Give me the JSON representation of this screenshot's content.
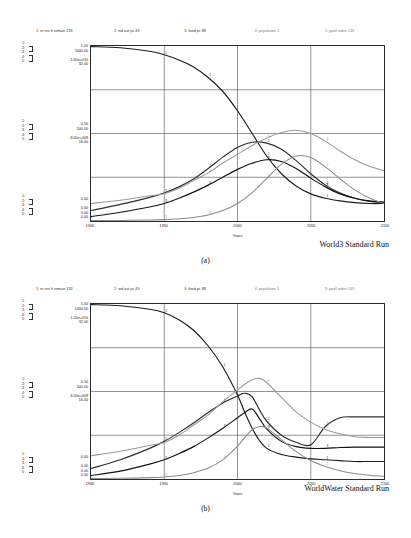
{
  "figure": {
    "panels": [
      {
        "letter": "(a)",
        "run_label": "World3 Standard Run",
        "legend": [
          "1: nr res fr remain 133",
          "2: ind out pc 49",
          "3: food pc 88",
          "4: population 1",
          "5: ppoll index 143"
        ],
        "scales": {
          "top": [
            "1.00",
            "1000.00",
            "1.60e+010",
            "32.00"
          ],
          "middle": [
            "0.50",
            "500.00",
            "8.00e+009",
            "16.00"
          ],
          "bottom": [
            "0.00",
            "0.00",
            "0.00",
            "0.00"
          ]
        },
        "index_labels": {
          "top": [
            "1:",
            "2:",
            "3:",
            "4:",
            "5:"
          ],
          "middle": [
            "1:",
            "2:",
            "3:",
            "4:",
            "5:"
          ],
          "bottom": [
            "1:",
            "2:",
            "3:",
            "4:",
            "5:"
          ]
        },
        "xaxis": {
          "title": "Years",
          "ticks": [
            "1900",
            "1950",
            "2000",
            "2050",
            "2100"
          ]
        }
      },
      {
        "letter": "(b)",
        "run_label": "WorldWater Standard Run",
        "legend": [
          "1: nr res fr remain 133",
          "2: ind out pc 49",
          "3: food pc 88",
          "4: population 1",
          "5: ppoll index 143"
        ],
        "scales": {
          "top": [
            "1.00",
            "1000.00",
            "1.20e+010",
            "32.00"
          ],
          "middle": [
            "0.50",
            "500.00",
            "6.00e+009",
            "16.00"
          ],
          "bottom": [
            "0.00",
            "0.00",
            "0.00",
            "0.00"
          ]
        },
        "index_labels": {
          "top": [
            "1:",
            "2:",
            "3:",
            "4:",
            "5:"
          ],
          "middle": [
            "1:",
            "2:",
            "3:",
            "4:",
            "5:"
          ],
          "bottom": [
            "1:",
            "2:",
            "3:",
            "4:",
            "5:"
          ]
        },
        "xaxis": {
          "title": "Years",
          "ticks": [
            "1900",
            "1950",
            "2000",
            "2050",
            "2100"
          ]
        }
      }
    ]
  },
  "chart_data": [
    {
      "type": "line",
      "title": "World3 Standard Run",
      "panel": "(a)",
      "xlabel": "Years",
      "ylabel": "",
      "xlim": [
        1900,
        2100
      ],
      "grid": true,
      "legend_position": "top",
      "x": [
        1900,
        1920,
        1940,
        1950,
        1960,
        1970,
        1980,
        1990,
        2000,
        2010,
        2020,
        2030,
        2040,
        2050,
        2060,
        2070,
        2080,
        2090,
        2100
      ],
      "series": [
        {
          "name": "nr res fr remain",
          "key": "1",
          "units": "fraction",
          "ylim": [
            0.0,
            1.0
          ],
          "values": [
            1.0,
            0.99,
            0.97,
            0.95,
            0.92,
            0.88,
            0.82,
            0.74,
            0.63,
            0.5,
            0.37,
            0.27,
            0.2,
            0.155,
            0.13,
            0.115,
            0.105,
            0.1,
            0.1
          ]
        },
        {
          "name": "ind out pc",
          "key": "2",
          "units": "dollars per person per year",
          "ylim": [
            0.0,
            1000.0
          ],
          "values": [
            60,
            95,
            135,
            160,
            195,
            240,
            300,
            365,
            420,
            450,
            445,
            410,
            345,
            270,
            205,
            160,
            130,
            112,
            105
          ]
        },
        {
          "name": "food pc",
          "key": "3",
          "units": "kilograms per person per year",
          "ylim": [
            0.0,
            1000.0
          ],
          "values": [
            25,
            50,
            80,
            100,
            130,
            165,
            205,
            250,
            295,
            330,
            350,
            340,
            300,
            245,
            195,
            155,
            130,
            115,
            108
          ]
        },
        {
          "name": "population",
          "key": "4",
          "units": "persons",
          "ylim": [
            0.0,
            16000000000.0
          ],
          "values": [
            1600000000.0,
            1900000000.0,
            2300000000.0,
            2500000000.0,
            3000000000.0,
            3700000000.0,
            4400000000.0,
            5300000000.0,
            6100000000.0,
            6900000000.0,
            7600000000.0,
            8100000000.0,
            8300000000.0,
            8000000000.0,
            7300000000.0,
            6400000000.0,
            5600000000.0,
            5000000000.0,
            4600000000.0
          ]
        },
        {
          "name": "ppoll index",
          "key": "5",
          "units": "index",
          "ylim": [
            0.0,
            32.0
          ],
          "values": [
            0.05,
            0.1,
            0.18,
            0.25,
            0.4,
            0.65,
            1.1,
            1.9,
            3.2,
            5.2,
            7.8,
            10.4,
            11.9,
            11.6,
            9.9,
            7.7,
            5.7,
            4.2,
            3.2
          ]
        }
      ]
    },
    {
      "type": "line",
      "title": "WorldWater Standard Run",
      "panel": "(b)",
      "xlabel": "Years",
      "ylabel": "",
      "xlim": [
        1900,
        2100
      ],
      "grid": true,
      "legend_position": "top",
      "x": [
        1900,
        1920,
        1940,
        1950,
        1960,
        1970,
        1980,
        1990,
        2000,
        2005,
        2010,
        2015,
        2020,
        2030,
        2040,
        2050,
        2060,
        2070,
        2080,
        2090,
        2100
      ],
      "series": [
        {
          "name": "nr res fr remain",
          "key": "1",
          "units": "fraction",
          "ylim": [
            0.0,
            1.0
          ],
          "values": [
            1.0,
            0.99,
            0.97,
            0.95,
            0.91,
            0.85,
            0.76,
            0.64,
            0.48,
            0.38,
            0.29,
            0.22,
            0.175,
            0.14,
            0.125,
            0.115,
            0.11,
            0.105,
            0.1,
            0.1,
            0.1
          ]
        },
        {
          "name": "ind out pc",
          "key": "2",
          "units": "dollars per person per year",
          "ylim": [
            0.0,
            1000.0
          ],
          "values": [
            60,
            110,
            175,
            215,
            265,
            320,
            380,
            435,
            475,
            490,
            470,
            395,
            330,
            250,
            210,
            195,
            300,
            350,
            355,
            355,
            355
          ]
        },
        {
          "name": "food pc",
          "key": "3",
          "units": "kilograms per person per year",
          "ylim": [
            0.0,
            1000.0
          ],
          "values": [
            20,
            45,
            85,
            110,
            145,
            185,
            235,
            290,
            350,
            380,
            400,
            345,
            285,
            215,
            185,
            175,
            175,
            180,
            182,
            182,
            182
          ]
        },
        {
          "name": "population",
          "key": "4",
          "units": "persons",
          "ylim": [
            0.0,
            12000000000.0
          ],
          "values": [
            1600000000.0,
            1900000000.0,
            2300000000.0,
            2500000000.0,
            3000000000.0,
            3700000000.0,
            4400000000.0,
            5300000000.0,
            6100000000.0,
            6500000000.0,
            6800000000.0,
            6900000000.0,
            6600000000.0,
            5600000000.0,
            4600000000.0,
            3900000000.0,
            3400000000.0,
            3100000000.0,
            2900000000.0,
            2850000000.0,
            2850000000.0
          ]
        },
        {
          "name": "ppoll index",
          "key": "5",
          "units": "index",
          "ylim": [
            0.0,
            32.0
          ],
          "values": [
            0.05,
            0.12,
            0.25,
            0.38,
            0.65,
            1.15,
            2.0,
            3.5,
            6.0,
            7.6,
            9.0,
            9.6,
            9.3,
            7.2,
            5.0,
            3.4,
            2.3,
            1.5,
            1.0,
            0.7,
            0.5
          ]
        }
      ]
    }
  ]
}
